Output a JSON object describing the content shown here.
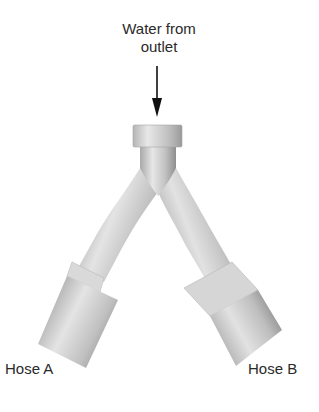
{
  "diagram": {
    "type": "labeled illustration",
    "inlet_label": {
      "line1": "Water from",
      "line2": "outlet"
    },
    "outlets": [
      {
        "label": "Hose A",
        "side": "left"
      },
      {
        "label": "Hose B",
        "side": "right"
      }
    ],
    "arrow": {
      "direction": "down",
      "meaning": "water flow into splitter"
    },
    "colors": {
      "pipe_light": "#e2e2e2",
      "pipe_mid": "#bdbdbd",
      "pipe_dark": "#8f8f8f",
      "arrow": "#111111",
      "text": "#2a2a2a"
    }
  }
}
